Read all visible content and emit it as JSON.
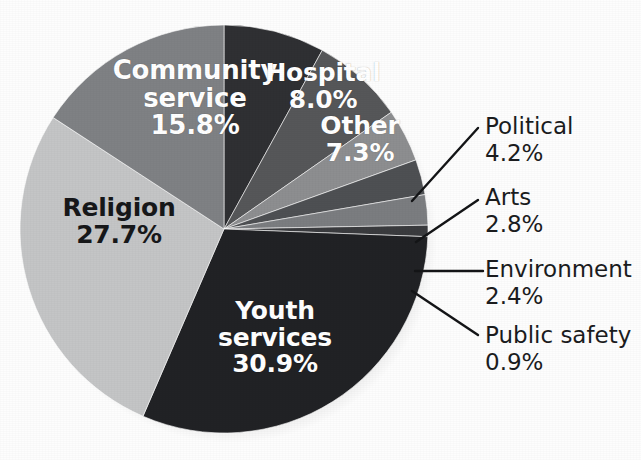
{
  "chart_data": {
    "type": "pie",
    "title": "",
    "subtitle": "",
    "xlabel": "",
    "ylabel": "",
    "legend_position": "none",
    "grid": false,
    "units": "percent",
    "categories": [
      "Hospital",
      "Other",
      "Political",
      "Arts",
      "Environment",
      "Public safety",
      "Youth services",
      "Religion",
      "Community service"
    ],
    "values": [
      8.0,
      7.3,
      4.2,
      2.8,
      2.4,
      0.9,
      30.9,
      27.7,
      15.8
    ],
    "slices": [
      {
        "label": "Hospital",
        "value_text": "8.0%",
        "value": 8.0,
        "color": "#2f3033",
        "label_placement": "inside",
        "label_color": "#ffffff"
      },
      {
        "label": "Other",
        "value_text": "7.3%",
        "value": 7.3,
        "color": "#565759",
        "label_placement": "inside",
        "label_color": "#ffffff"
      },
      {
        "label": "Political",
        "value_text": "4.2%",
        "value": 4.2,
        "color": "#8d8e90",
        "label_placement": "callout",
        "label_color": "#1b1c1e"
      },
      {
        "label": "Arts",
        "value_text": "2.8%",
        "value": 2.8,
        "color": "#4e5053",
        "label_placement": "callout",
        "label_color": "#1b1c1e"
      },
      {
        "label": "Environment",
        "value_text": "2.4%",
        "value": 2.4,
        "color": "#7b7d80",
        "label_placement": "callout",
        "label_color": "#1b1c1e"
      },
      {
        "label": "Public safety",
        "value_text": "0.9%",
        "value": 0.9,
        "color": "#3a3b3e",
        "label_placement": "callout",
        "label_color": "#1b1c1e"
      },
      {
        "label": "Youth services",
        "value_text": "30.9%",
        "value": 30.9,
        "color": "#212225",
        "label_placement": "inside",
        "label_color": "#ffffff"
      },
      {
        "label": "Religion",
        "value_text": "27.7%",
        "value": 27.7,
        "color": "#c4c5c6",
        "label_placement": "inside",
        "label_color": "#17181a"
      },
      {
        "label": "Community service",
        "value_text": "15.8%",
        "value": 15.8,
        "color": "#7f8184",
        "label_placement": "inside",
        "label_color": "#ffffff"
      }
    ]
  },
  "inside_labels": {
    "community_service": {
      "name_line1": "Community",
      "name_line2": "service",
      "value": "15.8%"
    },
    "hospital": {
      "name_line1": "Hospital",
      "value": "8.0%"
    },
    "other": {
      "name_line1": "Other",
      "value": "7.3%"
    },
    "religion": {
      "name_line1": "Religion",
      "value": "27.7%"
    },
    "youth_services": {
      "name_line1": "Youth",
      "name_line2": "services",
      "value": "30.9%"
    }
  },
  "callout_labels": {
    "political": {
      "name": "Political",
      "value": "4.2%"
    },
    "arts": {
      "name": "Arts",
      "value": "2.8%"
    },
    "environment": {
      "name": "Environment",
      "value": "2.4%"
    },
    "public_safety": {
      "name": "Public safety",
      "value": "0.9%"
    }
  },
  "colors": {
    "background": "#fdfdfd",
    "leader_line": "#141517",
    "text_dark": "#1b1c1e",
    "text_light": "#ffffff"
  }
}
